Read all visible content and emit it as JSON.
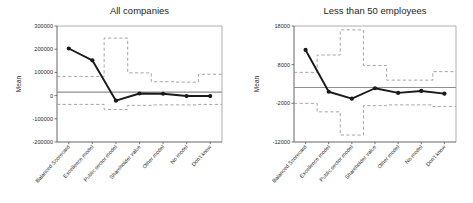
{
  "figure": {
    "background": "#ffffff",
    "panel_count": 2,
    "line_color": "#1a1a1a",
    "ci_color": "#9b9b9b",
    "ref_color": "#8e8e8e"
  },
  "chart_data": [
    {
      "type": "line",
      "panel": "left",
      "title": "All companies",
      "xlabel": "",
      "ylabel": "Mean",
      "categories": [
        "Balanced Scorecard",
        "Excellence model",
        "Public sector model",
        "Shareholder value",
        "Other model",
        "No model",
        "Don't know"
      ],
      "ylim": [
        -200000,
        300000
      ],
      "yticks": [
        -200000,
        -100000,
        0,
        100000,
        200000,
        300000
      ],
      "ytick_labels": [
        "-200000",
        "-100000",
        "0",
        "100000",
        "200000",
        "300000"
      ],
      "grid": false,
      "legend": "none",
      "series": [
        {
          "name": "Mean",
          "style": "solid-with-markers",
          "values": [
            203000,
            152000,
            -22000,
            9000,
            8000,
            -2000,
            -2000
          ]
        },
        {
          "name": "Upper confidence limit",
          "style": "dashed-step",
          "values": [
            82000,
            82000,
            248000,
            98000,
            60000,
            58000,
            92000
          ]
        },
        {
          "name": "Lower confidence limit",
          "style": "dashed-step",
          "values": [
            -38000,
            -38000,
            -60000,
            -42000,
            -40000,
            -40000,
            -38000
          ]
        }
      ],
      "reference_line": {
        "value": 15000,
        "style": "solid-gray"
      }
    },
    {
      "type": "line",
      "panel": "right",
      "title": "Less than 50 employees",
      "xlabel": "",
      "ylabel": "Mean",
      "categories": [
        "Balanced Scorecard",
        "Excellence model",
        "Public sector model",
        "Shareholder value",
        "Other model",
        "No model",
        "Don't know"
      ],
      "ylim": [
        -12000,
        18000
      ],
      "yticks": [
        -12000,
        -2000,
        8000,
        18000
      ],
      "ytick_labels": [
        "-12000",
        "-2000",
        "8000",
        "18000"
      ],
      "grid": false,
      "legend": "none",
      "series": [
        {
          "name": "Mean",
          "style": "solid-with-markers",
          "values": [
            11800,
            1000,
            -800,
            1900,
            700,
            1200,
            500
          ]
        },
        {
          "name": "Upper confidence limit",
          "style": "dashed-step",
          "values": [
            6000,
            10500,
            17000,
            7800,
            4000,
            4000,
            6200
          ]
        },
        {
          "name": "Lower confidence limit",
          "style": "dashed-step",
          "values": [
            -2000,
            -4200,
            -10200,
            -2600,
            -2400,
            -2400,
            -2800
          ]
        }
      ],
      "reference_line": {
        "value": 2100,
        "style": "solid-gray"
      }
    }
  ]
}
